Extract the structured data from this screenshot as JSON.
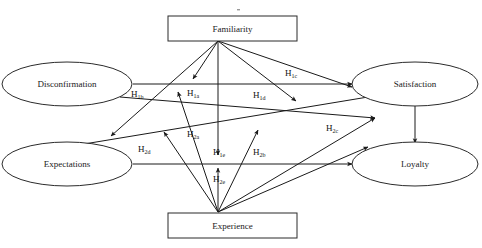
{
  "diagram": {
    "nodes": [
      {
        "id": "familiarity",
        "label": "Familiarity",
        "shape": "rectangle"
      },
      {
        "id": "experience",
        "label": "Experience",
        "shape": "rectangle"
      },
      {
        "id": "disconfirmation",
        "label": "Disconfirmation",
        "shape": "ellipse"
      },
      {
        "id": "expectations",
        "label": "Expectations",
        "shape": "ellipse"
      },
      {
        "id": "satisfaction",
        "label": "Satisfaction",
        "shape": "ellipse"
      },
      {
        "id": "loyalty",
        "label": "Loyalty",
        "shape": "ellipse"
      }
    ],
    "edge_labels": [
      {
        "id": "h1b",
        "base": "H",
        "sub": "1b"
      },
      {
        "id": "h1a",
        "base": "H",
        "sub": "1a"
      },
      {
        "id": "h1c",
        "base": "H",
        "sub": "1c"
      },
      {
        "id": "h1d",
        "base": "H",
        "sub": "1d"
      },
      {
        "id": "h2a",
        "base": "H",
        "sub": "2a"
      },
      {
        "id": "h1e",
        "base": "H",
        "sub": "1e"
      },
      {
        "id": "h2b",
        "base": "H",
        "sub": "2b"
      },
      {
        "id": "h2d",
        "base": "H",
        "sub": "2d"
      },
      {
        "id": "h2c",
        "base": "H",
        "sub": "2c"
      },
      {
        "id": "h2e",
        "base": "H",
        "sub": "2e"
      }
    ],
    "colors": {
      "stroke": "#1a1a1a",
      "shape_stroke": "#2b2b2b",
      "fill": "#ffffff",
      "text": "#111111",
      "background": "#ffffff"
    }
  }
}
